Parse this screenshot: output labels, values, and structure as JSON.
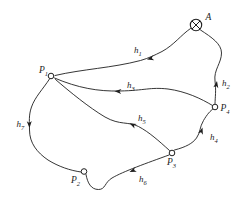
{
  "figure": {
    "background_color": "#ffffff",
    "line_color": "#1f1f1f",
    "nodes": [
      {
        "id": "A",
        "label": "A",
        "sub": "",
        "marker": "crossed-circle"
      },
      {
        "id": "P1",
        "label": "P",
        "sub": "1",
        "marker": "small-open-circle"
      },
      {
        "id": "P2",
        "label": "P",
        "sub": "2",
        "marker": "small-open-circle"
      },
      {
        "id": "P3",
        "label": "P",
        "sub": "3",
        "marker": "small-open-circle"
      },
      {
        "id": "P4",
        "label": "P",
        "sub": "4",
        "marker": "small-open-circle"
      }
    ],
    "edges": [
      {
        "id": "h1",
        "label": "h",
        "sub": "1",
        "endpoints": [
          "A",
          "P1"
        ],
        "arrow_toward": "P1"
      },
      {
        "id": "h2",
        "label": "h",
        "sub": "2",
        "endpoints": [
          "P4",
          "A"
        ],
        "arrow_toward": "A"
      },
      {
        "id": "h3",
        "label": "h",
        "sub": "3",
        "endpoints": [
          "P1",
          "P4"
        ],
        "arrow_toward": "P1"
      },
      {
        "id": "h4",
        "label": "h",
        "sub": "4",
        "endpoints": [
          "P3",
          "P4"
        ],
        "arrow_toward": "P4"
      },
      {
        "id": "h5",
        "label": "h",
        "sub": "5",
        "endpoints": [
          "P1",
          "P3"
        ],
        "arrow_toward": "P1"
      },
      {
        "id": "h6",
        "label": "h",
        "sub": "6",
        "endpoints": [
          "P2",
          "P3"
        ],
        "arrow_toward": "P2"
      },
      {
        "id": "h7",
        "label": "h",
        "sub": "7",
        "endpoints": [
          "P1",
          "P2"
        ],
        "arrow_toward": "P2"
      }
    ]
  }
}
